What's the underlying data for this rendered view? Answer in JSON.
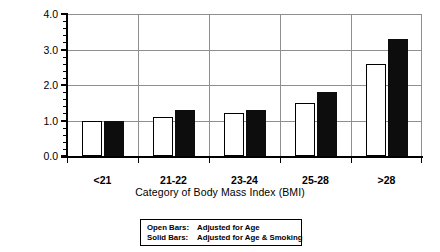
{
  "chart_data": {
    "type": "bar",
    "title": "",
    "xlabel": "Category of Body Mass Index (BMI)",
    "ylabel": "Relative Risk",
    "categories": [
      "<21",
      "21-22",
      "23-24",
      "25-28",
      ">28"
    ],
    "series": [
      {
        "name": "Open Bars:  Adjusted for Age",
        "style": "open",
        "values": [
          1.0,
          1.1,
          1.2,
          1.5,
          2.6
        ]
      },
      {
        "name": "Solid Bars:  Adjusted for Age & Smoking",
        "style": "solid",
        "values": [
          1.0,
          1.3,
          1.3,
          1.8,
          3.3
        ]
      }
    ],
    "ylim": [
      0.0,
      4.0
    ],
    "ytick_labels": [
      "0.0",
      "1.0",
      "2.0",
      "3.0",
      "4.0"
    ],
    "ytick_values": [
      0.0,
      1.0,
      2.0,
      3.0,
      4.0
    ],
    "yminor_step": 0.2,
    "grid": "horizontal-and-category-dividers",
    "legend_position": "below-plot-boxed"
  },
  "legend": {
    "line1_key": "Open Bars:",
    "line1_text": "Adjusted for Age",
    "line2_key": "Solid Bars:",
    "line2_text": "Adjusted for Age & Smoking"
  }
}
